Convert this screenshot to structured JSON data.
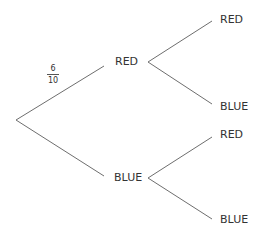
{
  "diagram": {
    "type": "probability-tree",
    "line_color": "#6e6e6e",
    "text_color": "#333333",
    "background": "#ffffff",
    "root": {
      "branches": [
        {
          "label": "RED",
          "probability": {
            "numerator": "6",
            "denominator": "10"
          },
          "children": [
            {
              "label": "RED"
            },
            {
              "label": "BLUE"
            }
          ]
        },
        {
          "label": "BLUE",
          "children": [
            {
              "label": "RED"
            },
            {
              "label": "BLUE"
            }
          ]
        }
      ]
    }
  }
}
